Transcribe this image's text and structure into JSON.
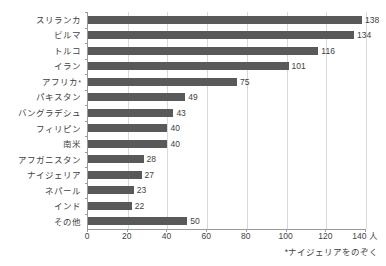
{
  "chart_data": {
    "type": "bar",
    "orientation": "horizontal",
    "title": "",
    "xlabel": "",
    "ylabel": "",
    "unit_suffix": "人",
    "categories": [
      "スリランカ",
      "ビルマ",
      "トルコ",
      "イラン",
      "アフリカ",
      "パキスタン",
      "バングラデシュ",
      "フィリピン",
      "南米",
      "アフガニスタン",
      "ナイジェリア",
      "ネパール",
      "インド",
      "その他"
    ],
    "category_marks": [
      "",
      "",
      "",
      "",
      "*",
      "",
      "",
      "",
      "",
      "",
      "",
      "",
      "",
      ""
    ],
    "values": [
      138,
      134,
      116,
      101,
      75,
      49,
      43,
      40,
      40,
      28,
      27,
      23,
      22,
      50
    ],
    "xlim": [
      0,
      140
    ],
    "xticks": [
      0,
      20,
      40,
      60,
      80,
      100,
      120,
      140
    ],
    "xtick_labels": [
      "0",
      "20",
      "40",
      "60",
      "80",
      "100",
      "120",
      "140 人"
    ],
    "grid": "vertical",
    "legend": "none",
    "bar_color": "#595959",
    "grid_color": "#d9d9d9",
    "axis_color": "#9a9a9a",
    "annotations": [
      "*ナイジェリアをのぞく"
    ]
  },
  "footnote": "*ナイジェリアをのぞく"
}
